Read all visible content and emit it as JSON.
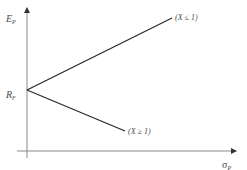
{
  "diagram": {
    "y_axis": {
      "label_main": "E",
      "label_sub": "P"
    },
    "x_axis": {
      "label_main": "σ",
      "label_sub": "P"
    },
    "intercept": {
      "label_main": "R",
      "label_sub": "F"
    },
    "lines": [
      {
        "name": "upper",
        "label": "(X ≤ 1)"
      },
      {
        "name": "lower",
        "label": "(X ≥ 1)"
      }
    ],
    "colors": {
      "axis": "#8a8a8a",
      "line": "#2a2a2a",
      "text": "#4a4a4a"
    }
  }
}
